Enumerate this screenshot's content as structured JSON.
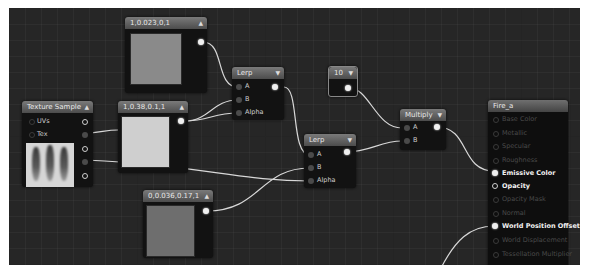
{
  "canvas": {
    "background": "#262626"
  },
  "nodes": {
    "const_a": {
      "title": "1,0.023,0,1",
      "swatch_color": "#8a8a8a"
    },
    "const_b": {
      "title": "1,0.38,0.1,1",
      "swatch_color": "#cfcfcf"
    },
    "const_c": {
      "title": "0,0.036,0.17,1",
      "swatch_color": "#6e6e6e"
    },
    "scalar": {
      "title": "10"
    },
    "texture_sample": {
      "title": "Texture Sample",
      "inputs": [
        "UVs",
        "Tex"
      ]
    },
    "lerp1": {
      "title": "Lerp",
      "inputs": [
        "A",
        "B",
        "Alpha"
      ]
    },
    "lerp2": {
      "title": "Lerp",
      "inputs": [
        "A",
        "B",
        "Alpha"
      ]
    },
    "multiply": {
      "title": "Multiply",
      "inputs": [
        "A",
        "B"
      ]
    },
    "material": {
      "title": "Fire_a",
      "pins": [
        {
          "label": "Base Color",
          "active": false
        },
        {
          "label": "Metallic",
          "active": false
        },
        {
          "label": "Specular",
          "active": false
        },
        {
          "label": "Roughness",
          "active": false
        },
        {
          "label": "Emissive Color",
          "active": true
        },
        {
          "label": "Opacity",
          "active": true
        },
        {
          "label": "Opacity Mask",
          "active": false
        },
        {
          "label": "Normal",
          "active": false
        },
        {
          "label": "World Position Offset",
          "active": true
        },
        {
          "label": "World Displacement",
          "active": false
        },
        {
          "label": "Tessellation Multiplier",
          "active": false
        },
        {
          "label": "Subsurface Color",
          "active": false
        }
      ]
    }
  },
  "icons": {
    "collapse": "▲",
    "expand": "▼"
  }
}
